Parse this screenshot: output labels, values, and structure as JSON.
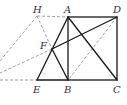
{
  "diagram": {
    "type": "geometry",
    "points": {
      "A": {
        "label": "A",
        "x": 68,
        "y": 17,
        "lx": 64,
        "ly": 13
      },
      "D": {
        "label": "D",
        "x": 117,
        "y": 17,
        "lx": 113,
        "ly": 13
      },
      "B": {
        "label": "B",
        "x": 68,
        "y": 80,
        "lx": 64,
        "ly": 93
      },
      "C": {
        "label": "C",
        "x": 117,
        "y": 80,
        "lx": 113,
        "ly": 93
      },
      "E": {
        "label": "E",
        "x": 37,
        "y": 80,
        "lx": 33,
        "ly": 93
      },
      "H": {
        "label": "H",
        "x": 37,
        "y": 16,
        "lx": 33,
        "ly": 13
      },
      "F": {
        "label": "F",
        "x": 52,
        "y": 49,
        "lx": 40,
        "ly": 49
      }
    },
    "solid_segments": [
      "AD",
      "DC",
      "CB",
      "BA",
      "EB",
      "EA",
      "FB",
      "AC",
      "FD"
    ],
    "dashed_segments": [
      "HA",
      "HF",
      "DB",
      "H-left",
      "F-left",
      "E-left"
    ],
    "colors": {
      "solid": "#1a1a1a",
      "dashed": "#777777",
      "label": "#333333"
    }
  }
}
